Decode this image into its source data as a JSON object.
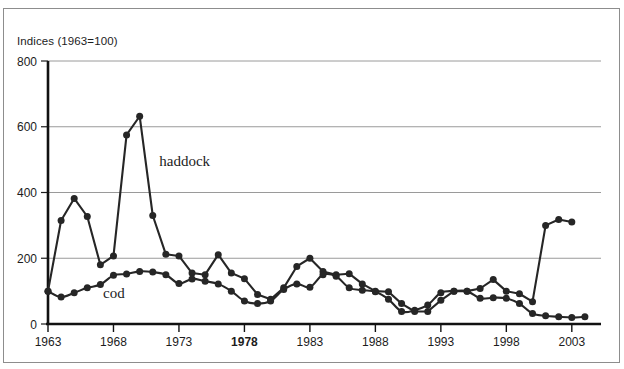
{
  "figure": {
    "axis_caption": "Indices (1963=100)",
    "frame_color": "#8d8d8d",
    "background": "#ffffff",
    "line_color": "#262626",
    "grid_color": "#9a9a9a"
  },
  "chart_data": {
    "type": "line",
    "title": "",
    "subtitle": "",
    "xlabel": "",
    "ylabel": "Indices (1963=100)",
    "xlim": [
      1963,
      2005
    ],
    "ylim": [
      0,
      800
    ],
    "yticks": [
      0,
      200,
      400,
      600,
      800
    ],
    "xticks": [
      1963,
      1968,
      1973,
      1978,
      1983,
      1988,
      1993,
      1998,
      2003
    ],
    "xtick_labels": [
      "1963",
      "1968",
      "1973",
      "1978",
      "1983",
      "1988",
      "1993",
      "1998",
      "2003"
    ],
    "xtick_bold": [
      "1978"
    ],
    "grid": "horizontal",
    "legend": "inline-annotations",
    "annotations": [
      {
        "text": "haddock",
        "x": 1971.5,
        "y": 480
      },
      {
        "text": "cod",
        "x": 1967.2,
        "y": 78
      }
    ],
    "x": [
      1963,
      1964,
      1965,
      1966,
      1967,
      1968,
      1969,
      1970,
      1971,
      1972,
      1973,
      1974,
      1975,
      1976,
      1977,
      1978,
      1979,
      1980,
      1981,
      1982,
      1983,
      1984,
      1985,
      1986,
      1987,
      1988,
      1989,
      1990,
      1991,
      1992,
      1993,
      1994,
      1995,
      1996,
      1997,
      1998,
      1999,
      2000,
      2001,
      2002,
      2003,
      2004
    ],
    "series": [
      {
        "name": "haddock",
        "markers": true,
        "values": [
          100,
          315,
          382,
          327,
          180,
          207,
          575,
          632,
          330,
          212,
          207,
          155,
          150,
          211,
          155,
          138,
          90,
          75,
          110,
          175,
          200,
          160,
          150,
          153,
          122,
          100,
          98,
          62,
          38,
          38,
          72,
          100,
          100,
          108,
          135,
          100,
          92,
          68,
          300,
          318,
          310,
          null
        ]
      },
      {
        "name": "cod",
        "markers": true,
        "smoothed": true,
        "values": [
          100,
          82,
          95,
          110,
          120,
          148,
          152,
          160,
          158,
          150,
          123,
          137,
          130,
          122,
          100,
          70,
          62,
          70,
          105,
          122,
          112,
          150,
          145,
          110,
          103,
          98,
          75,
          38,
          42,
          58,
          95,
          100,
          100,
          78,
          80,
          78,
          62,
          32,
          25,
          22,
          20,
          22
        ]
      }
    ]
  }
}
